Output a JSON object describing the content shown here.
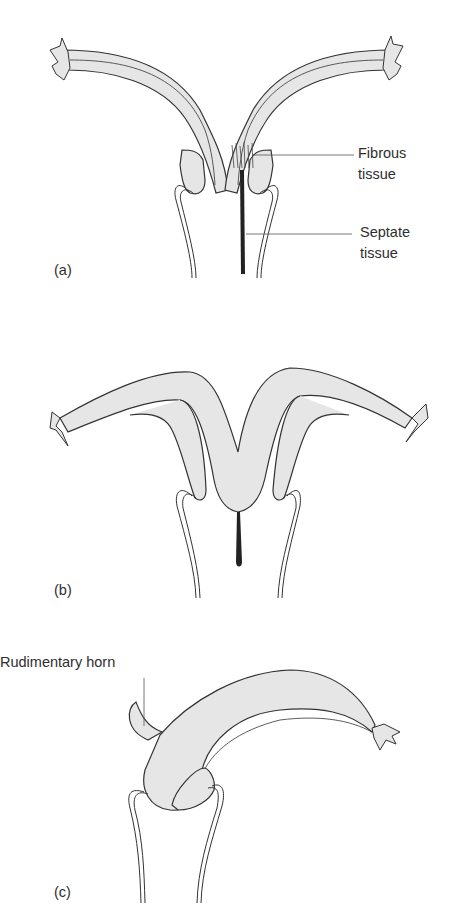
{
  "figure": {
    "colors": {
      "tissue_fill": "#e6e6e6",
      "outline": "#333333",
      "background": "#ffffff"
    },
    "panels": [
      {
        "id": "a",
        "letter": "(a)",
        "labels": [
          {
            "line1": "Fibrous",
            "line2": "tissue"
          },
          {
            "line1": "Septate",
            "line2": "tissue"
          }
        ]
      },
      {
        "id": "b",
        "letter": "(b)",
        "labels": []
      },
      {
        "id": "c",
        "letter": "(c)",
        "labels": [
          {
            "text": "Rudimentary horn"
          }
        ]
      }
    ]
  }
}
